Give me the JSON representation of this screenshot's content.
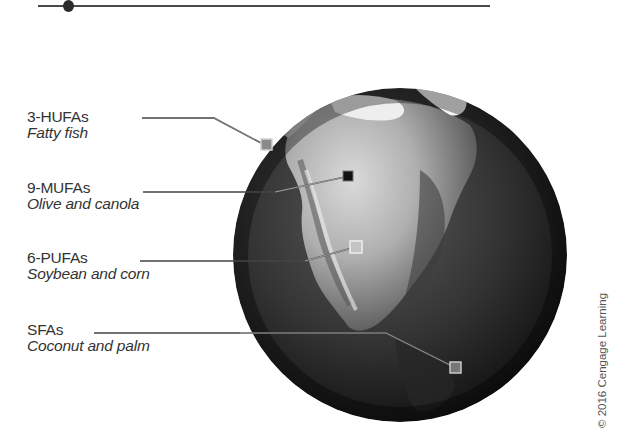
{
  "figure": {
    "top_rule": {
      "has_dot": true
    }
  },
  "labels": [
    {
      "id": "hufa",
      "title": "3-HUFAs",
      "source": "Fatty fish",
      "marker_style": "gray"
    },
    {
      "id": "mufa",
      "title": "9-MUFAs",
      "source": "Olive and canola",
      "marker_style": "dark"
    },
    {
      "id": "pufa",
      "title": "6-PUFAs",
      "source": "Soybean and corn",
      "marker_style": "light"
    },
    {
      "id": "sfa",
      "title": "SFAs",
      "source": "Coconut and palm",
      "marker_style": "gray"
    }
  ],
  "credit": "© 2016 Cengage Learning",
  "colors": {
    "ocean": "#2e2e2e",
    "land_light": "#d8d8d8",
    "ice": "#f4f4f4",
    "leader_line": "#444444",
    "text": "#333333"
  }
}
